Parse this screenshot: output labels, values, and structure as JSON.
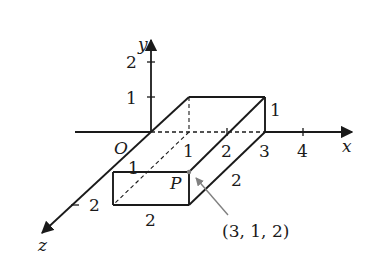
{
  "figure": {
    "type": "3d-coordinate-box",
    "axes": {
      "x": {
        "label": "x",
        "ticks": [
          "1",
          "2",
          "3",
          "4"
        ]
      },
      "y": {
        "label": "y",
        "ticks": [
          "1",
          "2"
        ]
      },
      "z": {
        "label": "z",
        "ticks": [
          "1",
          "2"
        ]
      },
      "origin_label": "O"
    },
    "box": {
      "dimensions": {
        "x": 3,
        "y": 1,
        "z": 2
      },
      "edge_labels": {
        "height_right": "1",
        "depth_right": "2",
        "width_front": "2",
        "front_left_z": "1"
      }
    },
    "point": {
      "label": "P",
      "coordinates_label": "(3, 1, 2)"
    },
    "colors": {
      "line": "#1a1a1a",
      "arrow": "#808080"
    }
  }
}
